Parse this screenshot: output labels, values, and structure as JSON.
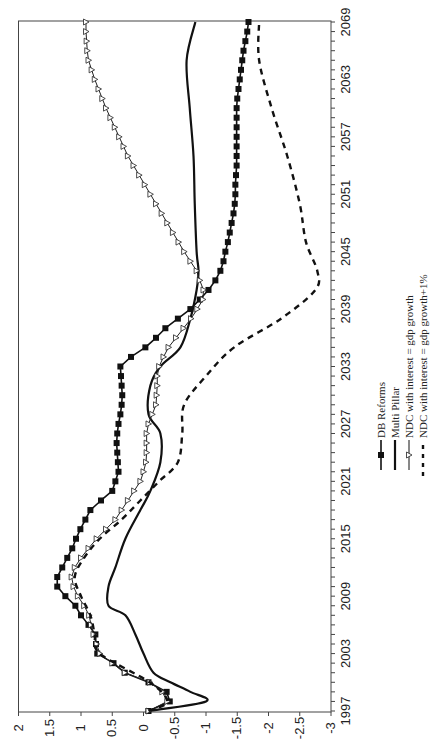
{
  "chart_data": {
    "type": "line",
    "orientation": "rotated-90-ccw",
    "title": "",
    "xlabel": "",
    "ylabel": "",
    "x_ticks": [
      "1997",
      "2003",
      "2009",
      "2015",
      "2021",
      "2027",
      "2033",
      "2039",
      "2045",
      "2051",
      "2057",
      "2063",
      "2069"
    ],
    "y_ticks": [
      "2",
      "1.5",
      "1",
      "0.5",
      "0",
      "-0.5",
      "-1",
      "-1.5",
      "-2",
      "-2.5",
      "-3"
    ],
    "xlim": [
      1997,
      2069
    ],
    "ylim": [
      -3,
      2
    ],
    "grid": false,
    "legend_position": "right-middle (rotated, below chart in page orientation)",
    "series": [
      {
        "name": "DB Reforms",
        "style": "solid-line-filled-square-markers",
        "x": [
          1997,
          1998,
          1999,
          2000,
          2001,
          2002,
          2003,
          2004,
          2005,
          2006,
          2007,
          2008,
          2009,
          2010,
          2011,
          2012,
          2013,
          2014,
          2015,
          2016,
          2017,
          2018,
          2019,
          2020,
          2021,
          2022,
          2023,
          2024,
          2025,
          2026,
          2027,
          2028,
          2029,
          2030,
          2031,
          2032,
          2033,
          2034,
          2035,
          2036,
          2037,
          2038,
          2039,
          2040,
          2041,
          2042,
          2043,
          2044,
          2045,
          2046,
          2047,
          2048,
          2049,
          2050,
          2051,
          2052,
          2053,
          2054,
          2055,
          2056,
          2057,
          2058,
          2059,
          2060,
          2061,
          2062,
          2063,
          2064,
          2065,
          2066,
          2067,
          2068,
          2069
        ],
        "values": [
          -0.08,
          -0.42,
          -0.37,
          -0.08,
          0.3,
          0.48,
          0.74,
          0.76,
          0.77,
          0.88,
          1.0,
          1.09,
          1.25,
          1.38,
          1.38,
          1.3,
          1.22,
          1.14,
          1.08,
          1.01,
          0.93,
          0.85,
          0.68,
          0.5,
          0.45,
          0.4,
          0.41,
          0.42,
          0.43,
          0.42,
          0.4,
          0.37,
          0.35,
          0.34,
          0.35,
          0.36,
          0.37,
          0.2,
          -0.03,
          -0.2,
          -0.35,
          -0.55,
          -0.75,
          -0.9,
          -1.04,
          -1.15,
          -1.23,
          -1.28,
          -1.31,
          -1.35,
          -1.38,
          -1.41,
          -1.44,
          -1.46,
          -1.47,
          -1.47,
          -1.48,
          -1.49,
          -1.49,
          -1.49,
          -1.49,
          -1.49,
          -1.49,
          -1.49,
          -1.5,
          -1.52,
          -1.54,
          -1.56,
          -1.58,
          -1.6,
          -1.63,
          -1.66,
          -1.68
        ]
      },
      {
        "name": "Multi Pillar",
        "style": "solid-thick-line",
        "x": [
          1997,
          1998,
          1999,
          2000,
          2001,
          2003,
          2005,
          2007,
          2008,
          2010,
          2012,
          2015,
          2018,
          2020,
          2023,
          2026,
          2028,
          2031,
          2033,
          2035,
          2038,
          2041,
          2043,
          2045,
          2050,
          2055,
          2060,
          2065,
          2069
        ],
        "values": [
          -0.08,
          -1.0,
          -0.75,
          -0.43,
          -0.16,
          0.0,
          0.13,
          0.29,
          0.56,
          0.56,
          0.45,
          0.29,
          0.05,
          -0.11,
          -0.27,
          -0.27,
          -0.08,
          -0.11,
          -0.27,
          -0.59,
          -0.75,
          -0.85,
          -0.88,
          -0.85,
          -0.82,
          -0.8,
          -0.74,
          -0.69,
          -0.83
        ]
      },
      {
        "name": "NDC with interest = gdp growth",
        "style": "thin-line-open-triangle-markers",
        "x": [
          1997,
          1998,
          1999,
          2000,
          2001,
          2002,
          2003,
          2004,
          2005,
          2006,
          2007,
          2008,
          2009,
          2010,
          2011,
          2012,
          2013,
          2014,
          2015,
          2016,
          2017,
          2018,
          2019,
          2020,
          2021,
          2022,
          2023,
          2024,
          2025,
          2026,
          2027,
          2028,
          2029,
          2030,
          2031,
          2032,
          2033,
          2034,
          2035,
          2036,
          2037,
          2038,
          2039,
          2040,
          2041,
          2042,
          2043,
          2044,
          2045,
          2046,
          2047,
          2048,
          2049,
          2050,
          2051,
          2052,
          2053,
          2054,
          2055,
          2056,
          2057,
          2058,
          2059,
          2060,
          2061,
          2062,
          2063,
          2064,
          2065,
          2066,
          2067,
          2068,
          2069
        ],
        "values": [
          -0.08,
          -0.38,
          -0.3,
          -0.1,
          0.3,
          0.5,
          0.7,
          0.75,
          0.8,
          0.84,
          0.87,
          0.95,
          1.05,
          1.12,
          1.15,
          1.1,
          1.0,
          0.88,
          0.75,
          0.6,
          0.45,
          0.35,
          0.25,
          0.15,
          0.05,
          0.0,
          -0.04,
          -0.05,
          -0.05,
          -0.05,
          -0.08,
          -0.14,
          -0.2,
          -0.21,
          -0.22,
          -0.22,
          -0.25,
          -0.32,
          -0.4,
          -0.52,
          -0.64,
          -0.76,
          -0.86,
          -0.95,
          -0.96,
          -0.9,
          -0.85,
          -0.75,
          -0.65,
          -0.56,
          -0.47,
          -0.38,
          -0.29,
          -0.2,
          -0.11,
          -0.02,
          0.07,
          0.16,
          0.25,
          0.32,
          0.39,
          0.46,
          0.53,
          0.6,
          0.66,
          0.72,
          0.78,
          0.83,
          0.88,
          0.9,
          0.91,
          0.92,
          0.92
        ]
      },
      {
        "name": "NDC with interest = gdp growth+1%",
        "style": "dashed-thick-line",
        "x": [
          1997,
          1998,
          2000,
          2003,
          2005,
          2007,
          2009,
          2011,
          2013,
          2015,
          2017,
          2019,
          2021,
          2023,
          2026,
          2029,
          2032,
          2035,
          2038,
          2041,
          2043,
          2046,
          2050,
          2055,
          2060,
          2065,
          2069
        ],
        "values": [
          -0.08,
          -0.38,
          -0.1,
          0.7,
          0.78,
          0.85,
          1.0,
          1.1,
          0.95,
          0.7,
          0.35,
          0.05,
          -0.25,
          -0.55,
          -0.62,
          -0.65,
          -1.0,
          -1.45,
          -2.2,
          -2.75,
          -2.78,
          -2.6,
          -2.5,
          -2.3,
          -2.05,
          -1.85,
          -1.85
        ]
      }
    ]
  },
  "legend": {
    "items": [
      {
        "label": "DB Reforms"
      },
      {
        "label": "Multi Pillar"
      },
      {
        "label": "NDC with interest = gdp growth"
      },
      {
        "label": "NDC with interest = gdp growth+1%"
      }
    ]
  }
}
